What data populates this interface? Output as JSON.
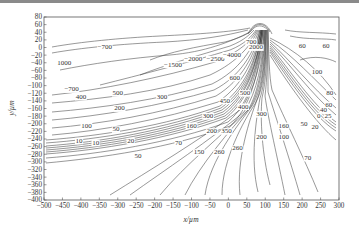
{
  "chart_data": {
    "type": "contour",
    "title": "",
    "xlabel": "x/µm",
    "ylabel": "y/µm",
    "xlim": [
      -500,
      300
    ],
    "ylim": [
      -400,
      80
    ],
    "x_ticks": [
      "-500",
      "-450",
      "-400",
      "-350",
      "-300",
      "-250",
      "-200",
      "-150",
      "-100",
      "-50",
      "0",
      "50",
      "100",
      "150",
      "200",
      "250",
      "300"
    ],
    "y_ticks": [
      "80",
      "60",
      "40",
      "20",
      "0",
      "-20",
      "-40",
      "-60",
      "-80",
      "-100",
      "-120",
      "-140",
      "-160",
      "-180",
      "-200",
      "-220",
      "-240",
      "-260",
      "-280",
      "-300",
      "-320",
      "-340",
      "-360",
      "-380",
      "-400"
    ],
    "grid": false,
    "contour_labels": [
      {
        "text": "-700",
        "x": -335,
        "y": -5
      },
      {
        "text": "1000",
        "x": -445,
        "y": -45
      },
      {
        "text": "-1500",
        "x": -150,
        "y": -50
      },
      {
        "text": "-2000",
        "x": -95,
        "y": -35
      },
      {
        "text": "-2500",
        "x": -35,
        "y": -35
      },
      {
        "text": "-4000",
        "x": 10,
        "y": -25
      },
      {
        "text": "700",
        "x": 62,
        "y": 10
      },
      {
        "text": "2000",
        "x": 75,
        "y": -5
      },
      {
        "text": "60",
        "x": 200,
        "y": 0
      },
      {
        "text": "60",
        "x": 265,
        "y": 0
      },
      {
        "text": "100",
        "x": 240,
        "y": -70
      },
      {
        "text": "80",
        "x": 275,
        "y": -125
      },
      {
        "text": "60",
        "x": 272,
        "y": -155
      },
      {
        "text": "40",
        "x": 258,
        "y": -170
      },
      {
        "text": "0",
        "x": 245,
        "y": -185
      },
      {
        "text": "25",
        "x": 270,
        "y": -185
      },
      {
        "text": "20",
        "x": 235,
        "y": -215
      },
      {
        "text": "-700",
        "x": -425,
        "y": -115
      },
      {
        "text": "500",
        "x": -300,
        "y": -125
      },
      {
        "text": "400",
        "x": -400,
        "y": -135
      },
      {
        "text": "300",
        "x": -180,
        "y": -135
      },
      {
        "text": "200",
        "x": -295,
        "y": -165
      },
      {
        "text": "100",
        "x": -385,
        "y": -210
      },
      {
        "text": "50",
        "x": -305,
        "y": -220
      },
      {
        "text": "10",
        "x": -405,
        "y": -250
      },
      {
        "text": "10",
        "x": -360,
        "y": -255
      },
      {
        "text": "20",
        "x": -265,
        "y": -250
      },
      {
        "text": "50",
        "x": -245,
        "y": -290
      },
      {
        "text": "70",
        "x": -135,
        "y": -255
      },
      {
        "text": "600",
        "x": 17,
        "y": -85
      },
      {
        "text": "500",
        "x": 45,
        "y": -125
      },
      {
        "text": "450",
        "x": -10,
        "y": -145
      },
      {
        "text": "400",
        "x": 40,
        "y": -160
      },
      {
        "text": "300",
        "x": -55,
        "y": -185
      },
      {
        "text": "300",
        "x": 90,
        "y": -180
      },
      {
        "text": "160",
        "x": -100,
        "y": -210
      },
      {
        "text": "160",
        "x": 150,
        "y": -210
      },
      {
        "text": "200",
        "x": -45,
        "y": -225
      },
      {
        "text": "350",
        "x": -5,
        "y": -225
      },
      {
        "text": "200",
        "x": 90,
        "y": -240
      },
      {
        "text": "150",
        "x": -80,
        "y": -280
      },
      {
        "text": "260",
        "x": -25,
        "y": -280
      },
      {
        "text": "260",
        "x": 25,
        "y": -270
      },
      {
        "text": "100",
        "x": 150,
        "y": -240
      },
      {
        "text": "50",
        "x": 205,
        "y": -205
      },
      {
        "text": "70",
        "x": 215,
        "y": -295
      }
    ]
  }
}
